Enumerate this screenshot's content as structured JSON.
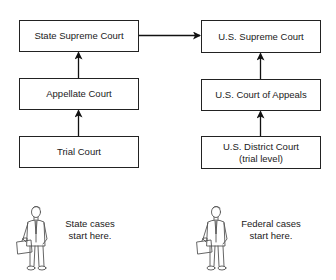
{
  "diagram": {
    "state_column": {
      "boxes": [
        {
          "id": "state-supreme-court",
          "label": "State Supreme Court"
        },
        {
          "id": "appellate-court",
          "label": "Appellate Court"
        },
        {
          "id": "trial-court",
          "label": "Trial Court"
        }
      ],
      "caption": {
        "line1": "State cases",
        "line2": "start here."
      }
    },
    "federal_column": {
      "boxes": [
        {
          "id": "us-supreme-court",
          "label": "U.S. Supreme Court"
        },
        {
          "id": "us-court-of-appeals",
          "label": "U.S. Court of Appeals"
        },
        {
          "id": "us-district-court",
          "label": "U.S. District Court",
          "sublabel": "(trial level)"
        }
      ],
      "caption": {
        "line1": "Federal cases",
        "line2": "start here."
      }
    },
    "edges": [
      {
        "from": "trial-court",
        "to": "appellate-court"
      },
      {
        "from": "appellate-court",
        "to": "state-supreme-court"
      },
      {
        "from": "us-district-court",
        "to": "us-court-of-appeals"
      },
      {
        "from": "us-court-of-appeals",
        "to": "us-supreme-court"
      },
      {
        "from": "state-supreme-court",
        "to": "us-supreme-court"
      }
    ],
    "icons": [
      "businessman-with-briefcase-icon",
      "businessman-with-briefcase-icon"
    ]
  }
}
